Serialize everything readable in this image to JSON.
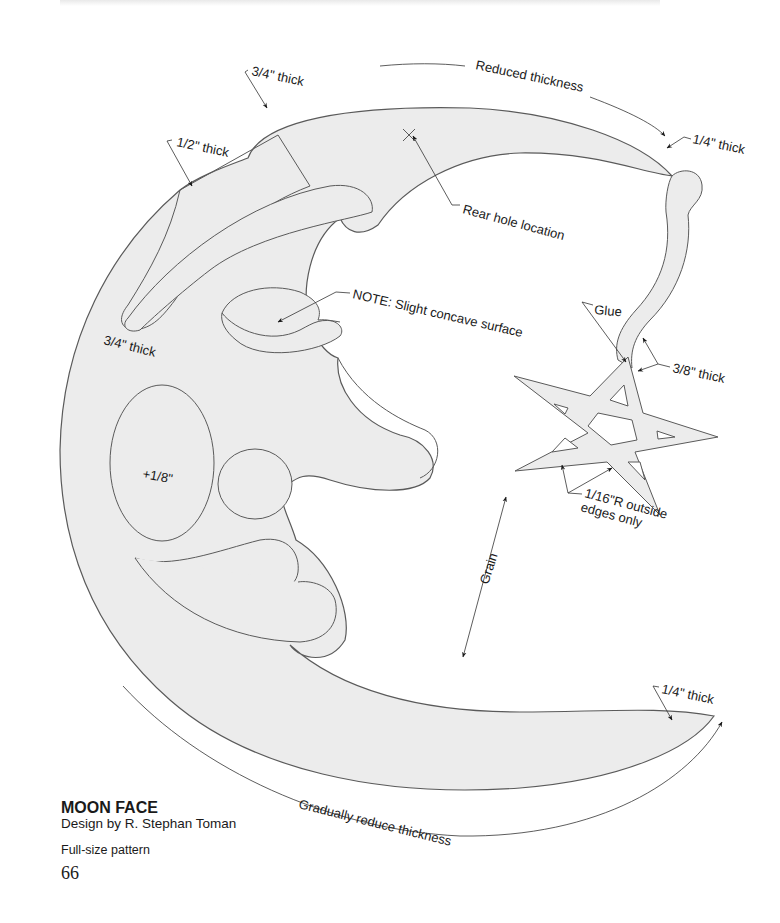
{
  "title_block": {
    "title": "MOON FACE",
    "byline": "Design by R. Stephan Toman",
    "subtitle": "Full-size pattern",
    "page_number": "66"
  },
  "annotations": {
    "top_left_thick": "3/4\" thick",
    "upper_left_thick": "1/2\" thick",
    "reduced_thickness": "Reduced thickness",
    "tip_thick_top": "1/4\" thick",
    "rear_hole": "Rear hole location",
    "note": "NOTE: Slight concave surface",
    "cheek_thick": "3/4\" thick",
    "cheek_raise": "+1/8\"",
    "glue": "Glue",
    "string_thick": "3/8\" thick",
    "radius_note_line1": "1/16\"R outside",
    "radius_note_line2": "edges only",
    "grain": "Grain",
    "tip_thick_bottom": "1/4\" thick",
    "gradually_reduce": "Gradually reduce thickness"
  },
  "colors": {
    "fill": "#ececec",
    "stroke": "#5a5a5a",
    "text": "#1a1a1a",
    "background": "#ffffff"
  }
}
